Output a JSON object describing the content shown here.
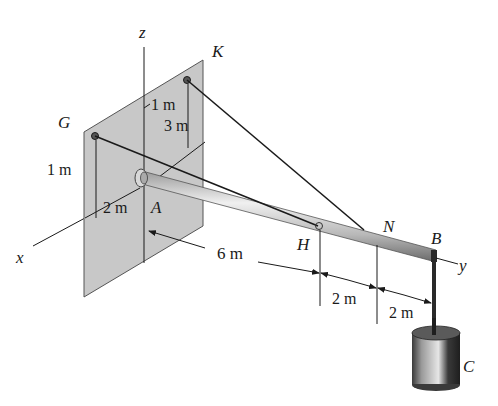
{
  "figure": {
    "colors": {
      "plate": "#c8c8c8",
      "plate_edge": "#555555",
      "line": "#1a1a1a",
      "rod_light": "#e8e8e8",
      "rod_dark": "#7a7a7a",
      "weight_dark": "#2a2a2a",
      "weight_light": "#d0d0d0"
    }
  },
  "axes": {
    "x": "x",
    "y": "y",
    "z": "z"
  },
  "points": {
    "A": "A",
    "B": "B",
    "C": "C",
    "G": "G",
    "H": "H",
    "K": "K",
    "N": "N"
  },
  "dimensions": {
    "k_horizontal": "1 m",
    "k_vertical": "3 m",
    "g_vertical": "1 m",
    "g_horizontal": "2 m",
    "a_to_h": "6 m",
    "h_to_n": "2 m",
    "n_to_b": "2 m"
  }
}
